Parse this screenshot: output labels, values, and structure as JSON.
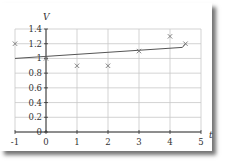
{
  "chart_data": {
    "type": "scatter",
    "title": "",
    "xlabel": "t",
    "ylabel": "V",
    "xlim": [
      -1,
      5
    ],
    "ylim": [
      0,
      1.4
    ],
    "x_ticks": [
      "-1",
      "0",
      "1",
      "2",
      "3",
      "4",
      "5"
    ],
    "y_ticks": [
      "0",
      "0.2",
      "0.4",
      "0.6",
      "0.8",
      "1",
      "1.2",
      "1.4"
    ],
    "grid": true,
    "legend": null,
    "series": [
      {
        "name": "data",
        "marker": "x",
        "x": [
          -1,
          0,
          1,
          2,
          3,
          4,
          4.5
        ],
        "y": [
          1.2,
          1.0,
          0.9,
          0.9,
          1.1,
          1.3,
          1.2
        ]
      },
      {
        "name": "fit",
        "style": "line",
        "x": [
          -1,
          4.4,
          4.5
        ],
        "y": [
          1.0,
          1.15,
          1.2
        ]
      }
    ],
    "colors": {
      "grid": "#c8c8c8",
      "axis": "#333333",
      "marker": "#777777",
      "line": "#555555"
    }
  }
}
